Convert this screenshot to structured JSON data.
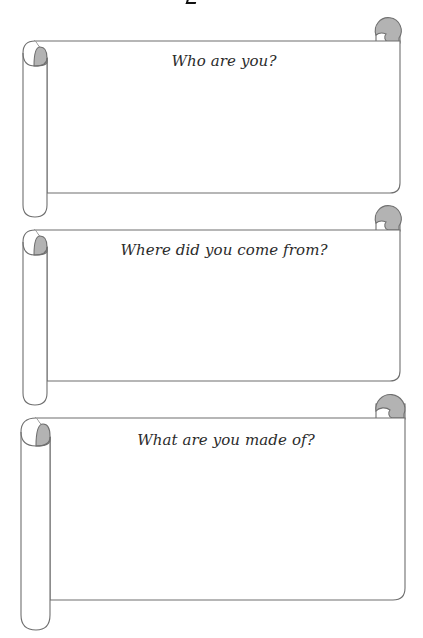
{
  "worksheet": {
    "scrolls": [
      {
        "id": 1,
        "prompt": "Who are you?",
        "answer": ""
      },
      {
        "id": 2,
        "prompt": "Where did you come from?",
        "answer": ""
      },
      {
        "id": 3,
        "prompt": "What are you made of?",
        "answer": ""
      }
    ],
    "colors": {
      "outline": "#6f6f6f",
      "curl_fill": "#b3b3b3",
      "paper": "#ffffff",
      "text": "#2b2b2b"
    }
  }
}
